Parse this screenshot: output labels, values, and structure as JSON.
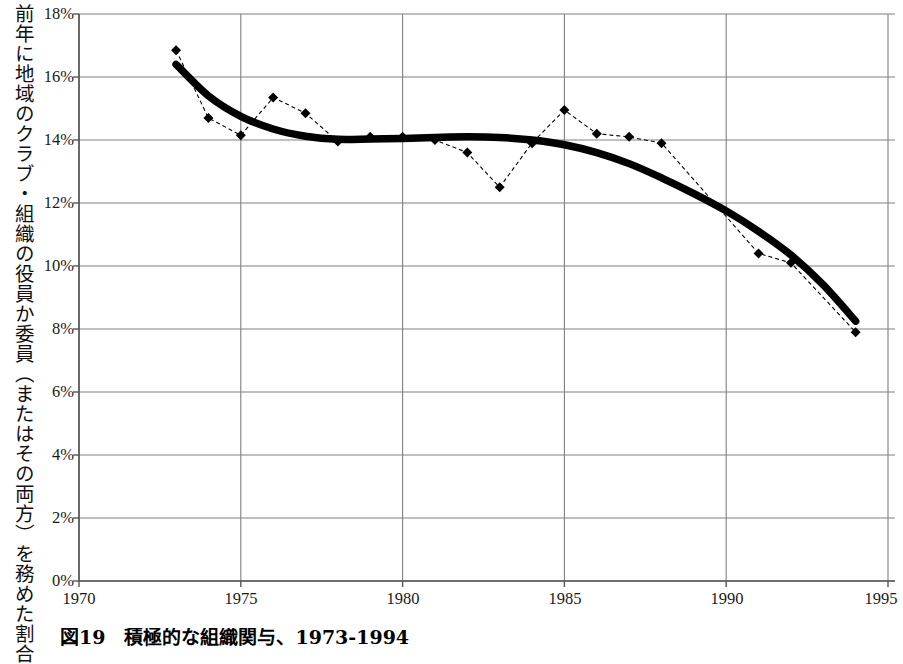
{
  "axis": {
    "y_title": "前年に地域のクラブ・組織の役員か委員（またはその両方）を務めた割合",
    "y_ticks": [
      "18%",
      "16%",
      "14%",
      "12%",
      "10%",
      "8%",
      "6%",
      "4%",
      "2%",
      "0%"
    ],
    "x_ticks": [
      "1970",
      "1975",
      "1980",
      "1985",
      "1990",
      "1995"
    ]
  },
  "caption": {
    "text": "図19　積極的な組織関与、1973-1994"
  },
  "colors": {
    "series_line": "#000000",
    "trend_line": "#000000",
    "grid": "#808080",
    "axis": "#555555",
    "background": "#ffffff"
  },
  "chart_data": {
    "type": "line",
    "title": "図19　積極的な組織関与、1973-1994",
    "xlabel": "",
    "ylabel": "前年に地域のクラブ・組織の役員か委員（またはその両方）を務めた割合",
    "xlim": [
      1970,
      1995
    ],
    "ylim": [
      0,
      18
    ],
    "y_unit": "%",
    "grid": true,
    "legend": "none",
    "x_ticks": [
      1970,
      1975,
      1980,
      1985,
      1990,
      1995
    ],
    "y_ticks": [
      0,
      2,
      4,
      6,
      8,
      10,
      12,
      14,
      16,
      18
    ],
    "series": [
      {
        "name": "observed",
        "style": "dashed-with-diamond-markers",
        "x": [
          1973,
          1974,
          1975,
          1976,
          1977,
          1978,
          1979,
          1980,
          1981,
          1982,
          1983,
          1984,
          1985,
          1986,
          1987,
          1988,
          1991,
          1992,
          1994
        ],
        "values": [
          16.85,
          14.7,
          14.15,
          15.35,
          14.85,
          13.95,
          14.1,
          14.1,
          14.0,
          13.6,
          12.5,
          13.9,
          14.95,
          14.2,
          14.1,
          13.9,
          10.4,
          10.1,
          7.9
        ]
      },
      {
        "name": "trend",
        "style": "thick-solid-smoothed",
        "x": [
          1973,
          1974,
          1975,
          1976,
          1977,
          1978,
          1979,
          1980,
          1981,
          1982,
          1983,
          1984,
          1985,
          1986,
          1987,
          1988,
          1989,
          1990,
          1991,
          1992,
          1993,
          1994
        ],
        "values": [
          16.4,
          15.4,
          14.75,
          14.35,
          14.12,
          14.02,
          14.03,
          14.05,
          14.08,
          14.1,
          14.08,
          14.0,
          13.85,
          13.6,
          13.25,
          12.8,
          12.3,
          11.75,
          11.1,
          10.35,
          9.4,
          8.25
        ]
      }
    ]
  }
}
